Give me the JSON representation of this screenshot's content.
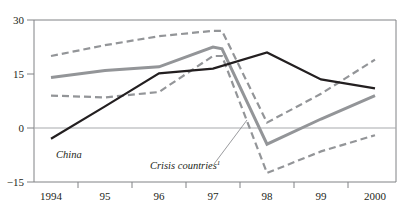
{
  "chart_data": {
    "type": "line",
    "title": "",
    "xlabel": "",
    "ylabel": "",
    "x": [
      "1994",
      "95",
      "96",
      "97",
      "97.5",
      "98",
      "99",
      "2000"
    ],
    "xtick_labels": [
      "1994",
      "95",
      "96",
      "97",
      "98",
      "99",
      "2000"
    ],
    "ytick_labels": [
      "30",
      "15",
      "0",
      "−15"
    ],
    "ylim": [
      -15,
      30
    ],
    "yticks": [
      -15,
      0,
      15,
      30
    ],
    "grid": false,
    "zero_line": true,
    "legend_position": "inline-annotation",
    "series": [
      {
        "name": "China",
        "style": "solid",
        "color": "#231f20",
        "width": 2.2,
        "x": [
          "1994",
          "95",
          "96",
          "97",
          "98",
          "99",
          "2000"
        ],
        "values": [
          -3.0,
          6.0,
          15.2,
          16.5,
          21.0,
          13.5,
          11.0
        ]
      },
      {
        "name": "Crisis countries mean",
        "style": "solid",
        "color": "#939598",
        "width": 3.0,
        "x": [
          "1994",
          "95",
          "96",
          "97",
          "97.5",
          "98",
          "99",
          "2000"
        ],
        "values": [
          14.0,
          16.0,
          17.0,
          22.5,
          22.0,
          -4.5,
          2.5,
          9.0
        ]
      },
      {
        "name": "Crisis countries upper band",
        "style": "dashed",
        "color": "#939598",
        "width": 2.2,
        "x": [
          "1994",
          "95",
          "96",
          "97",
          "97.5",
          "98",
          "99",
          "2000"
        ],
        "values": [
          20.0,
          23.0,
          25.5,
          27.0,
          27.0,
          1.5,
          9.5,
          19.0
        ]
      },
      {
        "name": "Crisis countries lower band",
        "style": "dashed",
        "color": "#939598",
        "width": 2.2,
        "x": [
          "1994",
          "95",
          "96",
          "97",
          "97.5",
          "98",
          "99",
          "2000"
        ],
        "values": [
          9.0,
          8.5,
          10.0,
          20.0,
          20.0,
          -12.5,
          -6.5,
          -2.0
        ]
      }
    ],
    "annotations": [
      {
        "name": "china-label",
        "text": "China",
        "superscript": "",
        "x": 56,
        "y": 158,
        "leader": null
      },
      {
        "name": "crisis-countries-label",
        "text": "Crisis countries",
        "superscript": "1",
        "x": 150,
        "y": 169,
        "leader": {
          "x1": 214,
          "y1": 164,
          "x2": 247,
          "y2": 120
        }
      }
    ],
    "colors": {
      "china_line": "#231f20",
      "crisis_line": "#939598",
      "axis": "#808285",
      "zero_line": "#a7a9ac",
      "background": "#ffffff"
    },
    "geometry": {
      "plot_left": 34,
      "plot_right": 396,
      "plot_top": 20,
      "plot_bottom": 182,
      "y_value_top": 30,
      "y_value_bottom": -15,
      "x_positions": {
        "1994": 51,
        "95": 105,
        "96": 159,
        "97": 213,
        "97.5": 222,
        "98": 267,
        "99": 321,
        "2000": 375
      },
      "x_tick_positions": [
        78,
        132,
        186,
        240,
        294,
        348
      ],
      "y_tick_positions": {
        "30": 20,
        "15": 74,
        "0": 128,
        "-15": 182
      }
    }
  }
}
